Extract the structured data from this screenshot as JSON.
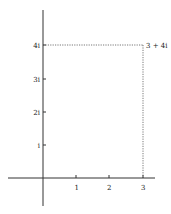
{
  "diagram": {
    "type": "argand-plane",
    "point": {
      "re": 3,
      "im": 4,
      "label": "3 + 4i"
    },
    "x_ticks": [
      {
        "value": 1,
        "label": "1"
      },
      {
        "value": 2,
        "label": "2"
      },
      {
        "value": 3,
        "label": "3"
      }
    ],
    "y_ticks": [
      {
        "value": 1,
        "label": "i"
      },
      {
        "value": 2,
        "label": "2i"
      },
      {
        "value": 3,
        "label": "3i"
      },
      {
        "value": 4,
        "label": "4i"
      }
    ],
    "colors": {
      "axis": "#333333",
      "dashed": "#555555",
      "text": "#222222"
    }
  }
}
